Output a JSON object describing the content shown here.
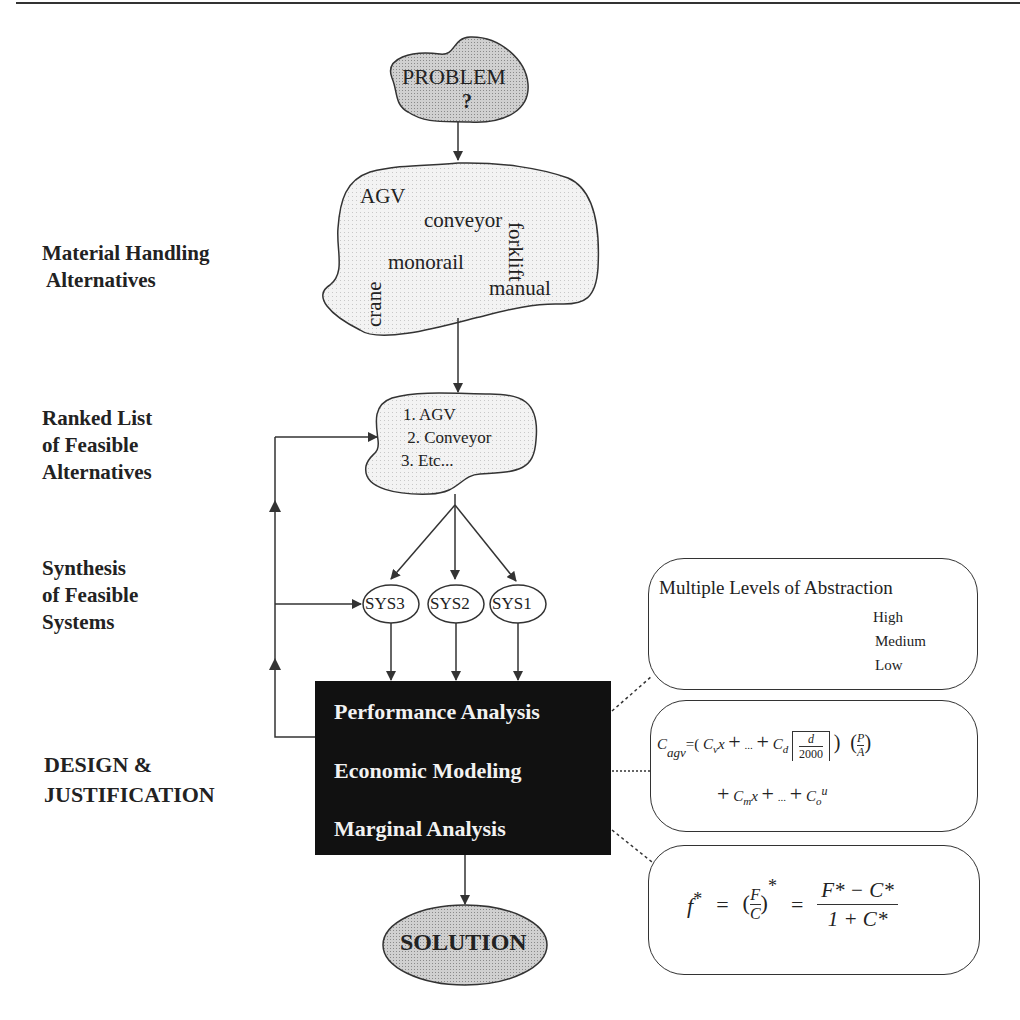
{
  "stage_labels": {
    "material_handling": [
      "Material Handling",
      " Alternatives"
    ],
    "ranked_list": [
      "Ranked List",
      "of Feasible",
      "Alternatives"
    ],
    "synthesis": [
      "Synthesis",
      "of Feasible",
      "Systems"
    ],
    "design": [
      "DESIGN &",
      "JUSTIFICATION"
    ]
  },
  "problem_node": {
    "title": "PROBLEM",
    "mark": "?"
  },
  "alternatives_blob": {
    "items": [
      "AGV",
      "conveyor",
      "forklift",
      "monorail",
      "manual",
      "crane"
    ]
  },
  "ranked_blob": {
    "items": [
      "1. AGV",
      " 2. Conveyor",
      "3. Etc..."
    ]
  },
  "systems": [
    "SYS3",
    "SYS2",
    "SYS1"
  ],
  "analysis_box": {
    "items": [
      "Performance Analysis",
      "Economic Modeling",
      "Marginal Analysis"
    ]
  },
  "solution_node": {
    "title": "SOLUTION"
  },
  "abstraction_box": {
    "title": "Multiple Levels of Abstraction",
    "levels": [
      "High",
      "Medium",
      "Low"
    ]
  },
  "cost_formula": {
    "line1": "C_agv = ( C_v x + ... + C_d ⌈ d / 2000 ⌉ ) ( P / A )",
    "line2": "+ C_m x + ... + C_o u",
    "parts": {
      "C": "C",
      "agv": "agv",
      "eq": "=(",
      "Cv": "C",
      "v": "v",
      "x": "x",
      "plus": "+",
      "dots": "...",
      "Cd": "C",
      "d_sub": "d",
      "d": "d",
      "n2000": "2000",
      "P": "P",
      "A": "A",
      "Cm": "C",
      "m": "m",
      "Co": "C",
      "o": "o",
      "u": "u"
    }
  },
  "marginal_formula": {
    "text": "f* = (F/C)* = (F* − C*) / (1 + C*)",
    "parts": {
      "f": "f",
      "star": "*",
      "eq": "=",
      "F": "F",
      "C": "C",
      "num": "F* − C*",
      "den": "1 + C*"
    }
  },
  "colors": {
    "line": "#333333",
    "blob_fill_dark": "#c4c4c4",
    "blob_fill_light": "#ececec",
    "box_fill": "#111111",
    "box_text": "#f2f2f2"
  }
}
